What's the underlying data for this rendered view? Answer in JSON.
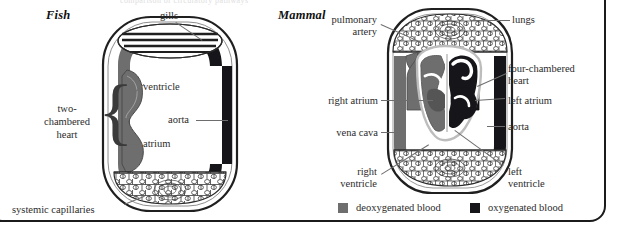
{
  "page": {
    "cut_top_text": "comparison of circulatory pathways",
    "frame_color": "#1b1b1b",
    "background": "#ffffff"
  },
  "colors": {
    "deoxygenated": "#6e6e6e",
    "oxygenated": "#16161a",
    "vessel_outline": "#2b2b2b",
    "body_outline": "#1f1f1f",
    "label_text": "#2b2b2b",
    "leader_line": "#6d6d6d"
  },
  "fish": {
    "title": "Fish",
    "labels": {
      "gills": "gills",
      "ventricle": "ventricle",
      "aorta": "aorta",
      "atrium": "atrium",
      "two_chambered_heart": "two-\nchambered\nheart",
      "two_chambered_heart_line1": "two-",
      "two_chambered_heart_line2": "chambered",
      "two_chambered_heart_line3": "heart",
      "systemic_capillaries": "systemic capillaries"
    }
  },
  "mammal": {
    "title": "Mammal",
    "labels": {
      "pulmonary_artery_line1": "pulmonary",
      "pulmonary_artery_line2": "artery",
      "lungs": "lungs",
      "four_chambered_heart_line1": "four-chambered",
      "four_chambered_heart_line2": "heart",
      "right_atrium": "right atrium",
      "left_atrium": "left atrium",
      "vena_cava": "vena cava",
      "aorta": "aorta",
      "right_ventricle_line1": "right",
      "right_ventricle_line2": "ventricle",
      "left_ventricle_line1": "left",
      "left_ventricle_line2": "ventricle"
    }
  },
  "legend": {
    "items": [
      {
        "label": "deoxygenated blood",
        "swatch_color": "#6e6e6e",
        "swatch_name": "deoxygenated-swatch"
      },
      {
        "label": "oxygenated blood",
        "swatch_color": "#16161a",
        "swatch_name": "oxygenated-swatch"
      }
    ],
    "deoxygenated_label": "deoxygenated blood",
    "oxygenated_label": "oxygenated blood"
  }
}
